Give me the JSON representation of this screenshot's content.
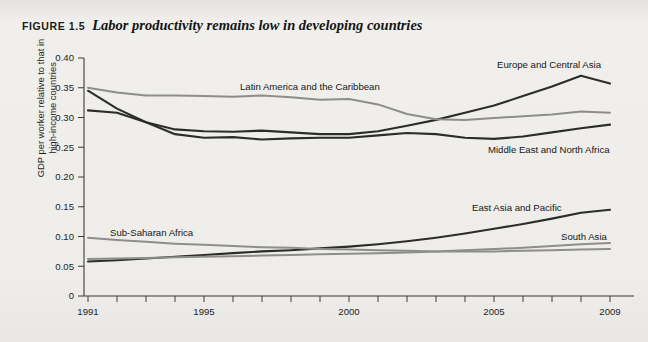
{
  "figure": {
    "label": "FIGURE 1.5",
    "title": "Labor productivity remains low in developing countries"
  },
  "axes": {
    "y_title_line1": "GDP per worker relative to that in",
    "y_title_line2": "high-income countries",
    "y_ticks": [
      "0.40",
      "0.35",
      "0.30",
      "0.25",
      "0.20",
      "0.15",
      "0.10",
      "0.05",
      "0"
    ],
    "x_ticks": [
      "1991",
      "1995",
      "2000",
      "2005",
      "2009"
    ]
  },
  "labels": {
    "latin_america": "Latin America and the Caribbean",
    "europe_central_asia": "Europe and Central Asia",
    "middle_east_north_africa": "Middle East and North Africa",
    "east_asia_pacific": "East Asia and Pacific",
    "south_asia": "South Asia",
    "sub_saharan_africa": "Sub-Saharan Africa"
  },
  "colors": {
    "dark_series": "#2c2c2c",
    "gray_series": "#8d8d8d",
    "axis": "#3b3b3b",
    "background": "#eceae7",
    "text": "#1d1d1d"
  },
  "chart_data": {
    "type": "line",
    "title": "Labor productivity remains low in developing countries",
    "xlabel": "",
    "ylabel": "GDP per worker relative to that in high-income countries",
    "xlim": [
      1991,
      2009
    ],
    "ylim": [
      0,
      0.4
    ],
    "grid": false,
    "legend": "inline-annotations",
    "x": [
      1991,
      1992,
      1993,
      1994,
      1995,
      1996,
      1997,
      1998,
      1999,
      2000,
      2001,
      2002,
      2003,
      2004,
      2005,
      2006,
      2007,
      2008,
      2009
    ],
    "series": [
      {
        "name": "Europe and Central Asia",
        "color": "#2c2c2c",
        "values": [
          0.345,
          0.315,
          0.292,
          0.28,
          0.277,
          0.276,
          0.278,
          0.275,
          0.272,
          0.272,
          0.277,
          0.286,
          0.296,
          0.308,
          0.32,
          0.336,
          0.352,
          0.37,
          0.357
        ]
      },
      {
        "name": "Latin America and the Caribbean",
        "color": "#8d8d8d",
        "values": [
          0.35,
          0.342,
          0.337,
          0.337,
          0.336,
          0.335,
          0.337,
          0.334,
          0.33,
          0.331,
          0.322,
          0.306,
          0.297,
          0.296,
          0.299,
          0.302,
          0.305,
          0.31,
          0.308
        ]
      },
      {
        "name": "Middle East and North Africa",
        "color": "#2c2c2c",
        "values": [
          0.312,
          0.308,
          0.292,
          0.272,
          0.266,
          0.267,
          0.263,
          0.265,
          0.266,
          0.266,
          0.27,
          0.274,
          0.272,
          0.266,
          0.264,
          0.268,
          0.275,
          0.282,
          0.288
        ]
      },
      {
        "name": "East Asia and Pacific",
        "color": "#2c2c2c",
        "values": [
          0.058,
          0.06,
          0.063,
          0.066,
          0.069,
          0.072,
          0.075,
          0.077,
          0.08,
          0.083,
          0.087,
          0.092,
          0.098,
          0.105,
          0.113,
          0.121,
          0.13,
          0.14,
          0.145
        ]
      },
      {
        "name": "South Asia",
        "color": "#8d8d8d",
        "values": [
          0.062,
          0.063,
          0.064,
          0.065,
          0.066,
          0.067,
          0.068,
          0.069,
          0.07,
          0.071,
          0.072,
          0.073,
          0.075,
          0.077,
          0.079,
          0.081,
          0.084,
          0.087,
          0.089
        ]
      },
      {
        "name": "Sub-Saharan Africa",
        "color": "#8d8d8d",
        "values": [
          0.098,
          0.094,
          0.091,
          0.088,
          0.086,
          0.084,
          0.082,
          0.081,
          0.079,
          0.078,
          0.077,
          0.076,
          0.075,
          0.075,
          0.075,
          0.076,
          0.077,
          0.078,
          0.079
        ]
      }
    ]
  }
}
